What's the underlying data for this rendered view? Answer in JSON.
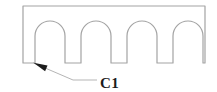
{
  "diagram": {
    "type": "technical-drawing",
    "callout": {
      "label": "C1"
    },
    "colors": {
      "outline": "#a3a3a3",
      "leader": "#b5b5b5",
      "ink": "#1c1c1c",
      "background": "#ffffff"
    },
    "geometry": {
      "rect": {
        "left": 23,
        "top": 6,
        "right": 205,
        "bottom": 63
      },
      "notch_radius": 15,
      "notch_shoulder_y": 36,
      "notches": [
        {
          "left": 35,
          "right": 65
        },
        {
          "left": 81,
          "right": 111
        },
        {
          "left": 127,
          "right": 157
        },
        {
          "left": 173,
          "right": 203
        }
      ],
      "leader_points": "33.5,63 73,80 97,80",
      "arrow_points": "33.5,62.8 45.1,71.2 47.5,65.6"
    }
  }
}
